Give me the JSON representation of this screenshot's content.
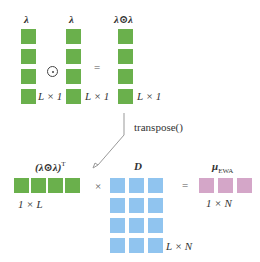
{
  "top_row": {
    "left_vector_label": "λ",
    "middle_vector_label": "λ",
    "result_vector_label": "λ⊙λ",
    "operator_hadamard": "⊙",
    "operator_equals": "=",
    "left_dim": "L × 1",
    "middle_dim": "L × 1",
    "result_dim": "L × 1"
  },
  "transpose": {
    "label": "transpose()"
  },
  "bottom_row": {
    "transposed_label": "(λ⊙λ)",
    "transposed_sup": "T",
    "transposed_dim": "1 × L",
    "operator_times": "×",
    "matrix_label": "D",
    "matrix_dim": "L × N",
    "operator_equals": "=",
    "result_label": "μ",
    "result_sub": "EWA",
    "result_dim": "1 × N"
  },
  "colors": {
    "green": "#6ab04c",
    "blue": "#90c4ef",
    "pink": "#d4a6c8"
  }
}
